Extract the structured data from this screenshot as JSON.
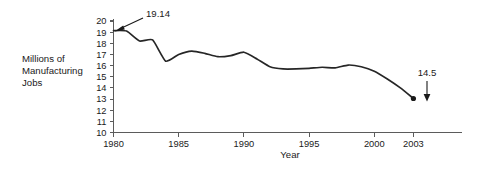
{
  "chart_data": {
    "type": "line",
    "title": "",
    "xlabel": "Year",
    "ylabel": "Millions of Manufacturing Jobs",
    "ylabel_lines": [
      "Millions of",
      "Manufacturing",
      "Jobs"
    ],
    "xlim": [
      1980,
      2004
    ],
    "ylim": [
      10,
      20
    ],
    "grid": false,
    "legend": false,
    "x_ticks": [
      1980,
      1985,
      1990,
      1995,
      2000,
      2003
    ],
    "x_tick_labels": [
      "1980",
      "1985",
      "1990",
      "1995",
      "2000",
      "2003"
    ],
    "y_ticks": [
      10,
      11,
      12,
      13,
      14,
      15,
      16,
      17,
      18,
      19,
      20
    ],
    "y_tick_labels": [
      "10",
      "11",
      "12",
      "13",
      "14",
      "15",
      "16",
      "17",
      "18",
      "19",
      "20"
    ],
    "series_name": "Manufacturing jobs",
    "x": [
      1980,
      1981,
      1982,
      1983,
      1984,
      1985,
      1986,
      1987,
      1988,
      1989,
      1990,
      1991,
      1992,
      1993,
      1994,
      1995,
      1996,
      1997,
      1998,
      1999,
      2000,
      2001,
      2002,
      2003
    ],
    "values": [
      19.14,
      19.1,
      18.2,
      18.3,
      16.4,
      17.0,
      17.3,
      17.1,
      16.8,
      16.9,
      17.2,
      16.6,
      15.9,
      15.7,
      15.7,
      15.75,
      15.85,
      15.8,
      16.05,
      15.9,
      15.5,
      14.8,
      14.0,
      13.05
    ],
    "annotations": [
      {
        "name": "start-value-callout",
        "label": "19.14",
        "points_to_x": 1980,
        "points_to_y": 19.14,
        "direction": "down-left"
      },
      {
        "name": "end-value-callout",
        "label": "14.5",
        "points_to_x": 2003,
        "points_to_y": 13.05,
        "direction": "down"
      }
    ],
    "endpoint_marker": {
      "x": 2003,
      "y": 13.05,
      "shape": "dot"
    }
  },
  "colors": {
    "background": "#ffffff",
    "curve": "#262626",
    "axis": "#5b5b5b",
    "text": "#1a1a1a"
  }
}
